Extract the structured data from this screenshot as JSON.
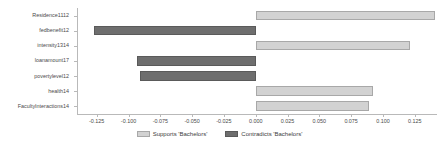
{
  "chart_data": {
    "type": "bar",
    "orientation": "horizontal",
    "title": "",
    "xlabel": "",
    "ylabel": "",
    "categories": [
      "Residence1112",
      "fedbenefit12",
      "intensity1314",
      "loanamount17",
      "povertylevel12",
      "health14",
      "FacultyInteractions14"
    ],
    "values": [
      0.141,
      -0.127,
      0.121,
      -0.093,
      -0.091,
      0.092,
      0.089
    ],
    "groups": [
      "Supports 'Bachelors'",
      "Contradicts 'Bachelors'",
      "Supports 'Bachelors'",
      "Contradicts 'Bachelors'",
      "Contradicts 'Bachelors'",
      "Supports 'Bachelors'",
      "Supports 'Bachelors'"
    ],
    "xlim": [
      -0.1405,
      0.1425
    ],
    "xticks": [
      -0.125,
      -0.1,
      -0.075,
      -0.05,
      -0.025,
      0,
      0.025,
      0.05,
      0.075,
      0.1,
      0.125
    ],
    "xticklabels": [
      "-0.125",
      "-0.100",
      "-0.075",
      "-0.050",
      "-0.025",
      "0.000",
      "0.025",
      "0.050",
      "0.075",
      "0.100",
      "0.125"
    ],
    "grid": false,
    "legend": {
      "position": "bottom-center",
      "entries": [
        {
          "label": "Supports 'Bachelors'",
          "color": "#d2d2d2",
          "key": "supports"
        },
        {
          "label": "Contradicts 'Bachelors'",
          "color": "#6e6e6e",
          "key": "contradicts"
        }
      ]
    },
    "colors": {
      "supports": "#d2d2d2",
      "supports_edge": "#a8a8a8",
      "contradicts": "#6e6e6e",
      "contradicts_edge": "#5a5a5a",
      "axis": "#b9b9b9",
      "text": "#4a4a4a",
      "background": "#ffffff"
    }
  }
}
